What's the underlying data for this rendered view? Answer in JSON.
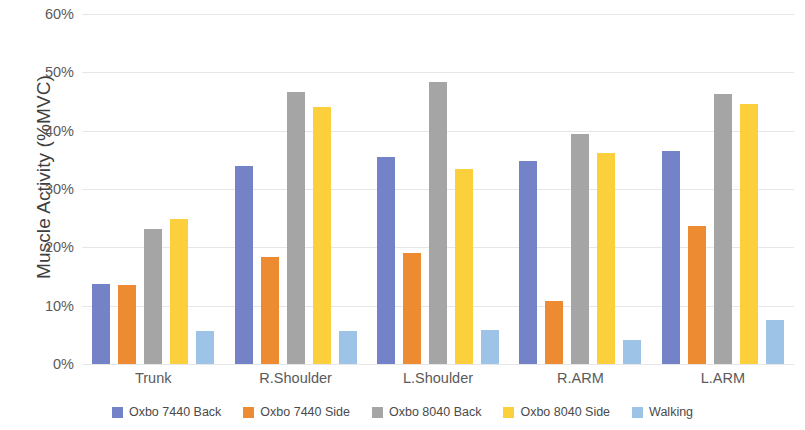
{
  "chart_data": {
    "type": "bar",
    "title": "",
    "xlabel": "",
    "ylabel": "Muscle Activity (%MVC)",
    "ylim": [
      0,
      60
    ],
    "ytick_labels": [
      "60%",
      "50%",
      "40%",
      "30%",
      "20%",
      "10%",
      "0%"
    ],
    "ytick_values": [
      60,
      50,
      40,
      30,
      20,
      10,
      0
    ],
    "grid": true,
    "legend_position": "bottom",
    "categories": [
      "Trunk",
      "R.Shoulder",
      "L.Shoulder",
      "R.ARM",
      "L.ARM"
    ],
    "series": [
      {
        "name": "Oxbo 7440 Back",
        "color": "#7482c8",
        "values": [
          13.8,
          34.0,
          35.5,
          34.8,
          36.6
        ]
      },
      {
        "name": "Oxbo 7440 Side",
        "color": "#ed8b33",
        "values": [
          13.5,
          18.3,
          19.0,
          10.8,
          23.7
        ]
      },
      {
        "name": "Oxbo 8040 Back",
        "color": "#a5a5a5",
        "values": [
          23.2,
          46.7,
          48.4,
          39.5,
          46.3
        ]
      },
      {
        "name": "Oxbo 8040 Side",
        "color": "#fccf3d",
        "values": [
          24.8,
          44.0,
          33.5,
          36.1,
          44.6
        ]
      },
      {
        "name": "Walking",
        "color": "#9dc3e6",
        "values": [
          5.6,
          5.7,
          5.9,
          4.2,
          7.6
        ]
      }
    ]
  }
}
